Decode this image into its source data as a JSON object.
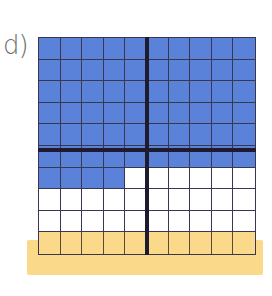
{
  "figure": {
    "label": "d)",
    "grid": {
      "rows": 10,
      "cols": 10,
      "shaded_count": 64,
      "shaded_color": "#5a82d8",
      "unshaded_color": "#ffffff",
      "highlight_row": 10,
      "highlight_color": "#fbd98a",
      "divider_color": "#1f1b2e"
    }
  }
}
